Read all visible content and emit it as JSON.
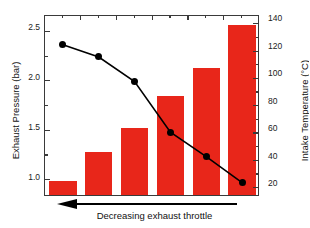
{
  "chart_data": {
    "type": "bar",
    "title": "",
    "xlabel": "",
    "ylabel": "Exhaust Pressure (bar)",
    "ylabel_secondary": "Intake Temperature (°C)",
    "categories": [
      "1",
      "2",
      "3",
      "4",
      "5",
      "6"
    ],
    "grid": false,
    "legend": "none",
    "ylim": [
      0.83,
      2.66
    ],
    "ylim_secondary": [
      13.5,
      146
    ],
    "yticks": [
      1.0,
      1.5,
      2.0,
      2.5
    ],
    "ytick_labels": [
      "1.0",
      "1.5",
      "2.0",
      "2.5"
    ],
    "yticks_secondary": [
      20,
      40,
      60,
      80,
      100,
      120,
      140
    ],
    "ytick_labels_secondary": [
      "20",
      "40",
      "60",
      "80",
      "100",
      "120",
      "140"
    ],
    "series": [
      {
        "name": "Exhaust Pressure",
        "type": "bar",
        "axis": "left",
        "unit": "bar",
        "color": "#E8261A",
        "values": [
          0.97,
          1.26,
          1.51,
          1.83,
          2.11,
          2.55
        ]
      },
      {
        "name": "Intake Temperature",
        "type": "line",
        "axis": "right",
        "unit": "°C",
        "color": "#000000",
        "marker": "filled-circle",
        "values": [
          125,
          116,
          98,
          61,
          43,
          24
        ]
      }
    ],
    "annotations": [
      {
        "text": "Decreasing exhaust throttle",
        "arrow": "left",
        "position": "below-x-axis"
      }
    ]
  },
  "axes": {
    "left": {
      "title": "Exhaust Pressure (bar)",
      "tick_labels": [
        "2.5",
        "2.0",
        "1.5",
        "1.0"
      ]
    },
    "right": {
      "title": "Intake Temperature (°C)",
      "tick_labels": [
        "140",
        "120",
        "100",
        "80",
        "60",
        "40",
        "20"
      ]
    }
  },
  "annotation": {
    "label": "Decreasing exhaust throttle"
  },
  "colors": {
    "bar": "#E8261A",
    "line": "#000000",
    "axis": "#3a3a3a",
    "background": "#ffffff"
  }
}
